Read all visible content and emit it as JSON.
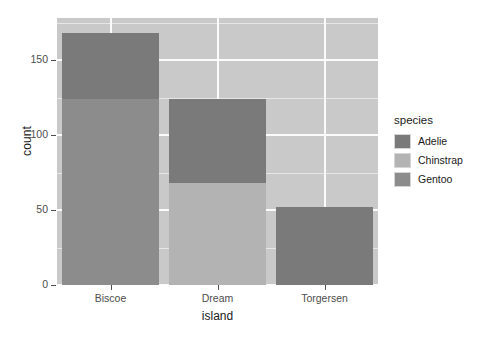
{
  "chart_data": {
    "type": "bar",
    "subtype": "stacked-bar",
    "title": "",
    "xlabel": "island",
    "ylabel": "count",
    "categories": [
      "Biscoe",
      "Dream",
      "Torgersen"
    ],
    "series": [
      {
        "name": "Adelie",
        "values": [
          44,
          56,
          52
        ],
        "color": "#7a7a7a"
      },
      {
        "name": "Chinstrap",
        "values": [
          0,
          68,
          0
        ],
        "color": "#b3b3b3"
      },
      {
        "name": "Gentoo",
        "values": [
          124,
          0,
          0
        ],
        "color": "#8c8c8c"
      }
    ],
    "totals": [
      168,
      124,
      52
    ],
    "ylim": [
      0,
      178
    ],
    "y_ticks": [
      0,
      50,
      100,
      150
    ],
    "y_tick_labels": [
      "0",
      "50",
      "100",
      "150"
    ],
    "y_minor_ticks": [
      25,
      75,
      125,
      175
    ],
    "grid": true,
    "legend_position": "right",
    "legend_title": "species",
    "legend_entries": [
      "Adelie",
      "Chinstrap",
      "Gentoo"
    ],
    "panel_background": "#c9c9c9",
    "grid_major_color": "#fbfbfb",
    "grid_minor_color": "#e6e6e6",
    "axis_text_color": "#4d4d4d",
    "axis_title_color": "#1a1a1a"
  }
}
